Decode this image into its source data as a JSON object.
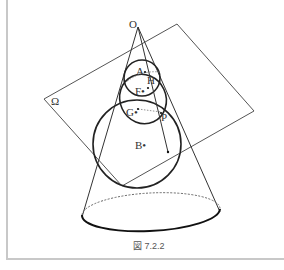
{
  "figure": {
    "caption": "図 7.2.2",
    "labels": {
      "O": "O",
      "A": "A",
      "H": "H",
      "F": "F•",
      "G": "G•",
      "P": "P",
      "B": "B•",
      "plane": "Ω"
    },
    "elements": [
      "cone with apex O",
      "plane Ω cutting the cone",
      "small inscribed sphere (center A, tangent point F)",
      "large inscribed sphere (center B, tangent point G)",
      "conic section through point P",
      "base ellipse (front solid, back dashed)"
    ]
  }
}
